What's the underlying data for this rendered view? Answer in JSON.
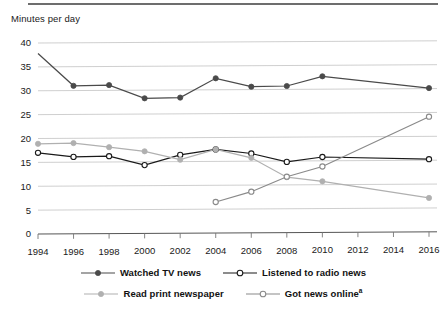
{
  "axis_title": "Minutes per day",
  "chart_data": {
    "type": "line",
    "title": "",
    "subtitle": "",
    "xlabel": "",
    "ylabel": "Minutes per day",
    "ylim": [
      0,
      40
    ],
    "ytick_step": 5,
    "yticks": [
      "0",
      "5",
      "10",
      "15",
      "20",
      "25",
      "30",
      "35",
      "40"
    ],
    "xlim": [
      1994,
      2016
    ],
    "xtick_step": 2,
    "categories": [
      1994,
      1996,
      1998,
      2000,
      2002,
      2004,
      2006,
      2008,
      2010,
      2012,
      2014,
      2016
    ],
    "xticks": [
      "1994",
      "1996",
      "1998",
      "2000",
      "2002",
      "2004",
      "2006",
      "2008",
      "2010",
      "2012",
      "2014",
      "2016"
    ],
    "grid": "horizontal",
    "legend_position": "bottom",
    "series": [
      {
        "name": "Watched TV news",
        "color": "#4a4a4a",
        "marker": "filled-circle",
        "x": [
          1994,
          1996,
          1998,
          2000,
          2002,
          2004,
          2006,
          2008,
          2010,
          2016
        ],
        "values": [
          37.8,
          31.0,
          31.1,
          28.3,
          28.4,
          32.4,
          30.6,
          30.7,
          32.7,
          30.1
        ]
      },
      {
        "name": "Listened to radio news",
        "color": "#1a1a1a",
        "marker": "open-circle",
        "x": [
          1994,
          1996,
          1998,
          2000,
          2002,
          2004,
          2006,
          2008,
          2010,
          2016
        ],
        "values": [
          17.0,
          16.1,
          16.2,
          14.3,
          16.4,
          17.5,
          16.6,
          14.8,
          15.8,
          15.2
        ]
      },
      {
        "name": "Read print newspaper",
        "color": "#b0b0b0",
        "marker": "filled-circle",
        "x": [
          1994,
          1996,
          1998,
          2000,
          2002,
          2004,
          2006,
          2008,
          2010,
          2016
        ],
        "values": [
          18.9,
          19.0,
          18.1,
          17.2,
          15.4,
          17.5,
          15.7,
          11.6,
          10.7,
          7.1
        ]
      },
      {
        "name": "Got news online",
        "name_footnote": "a",
        "color": "#8a8a8a",
        "marker": "open-circle",
        "x": [
          2004,
          2006,
          2008,
          2010,
          2016
        ],
        "values": [
          6.5,
          8.6,
          11.7,
          13.8,
          24.1
        ]
      }
    ]
  },
  "legend": {
    "rows": [
      [
        {
          "label": "Watched TV news",
          "color": "#4a4a4a",
          "marker": "filled-circle"
        },
        {
          "label": "Listened to radio news",
          "color": "#1a1a1a",
          "marker": "open-circle"
        }
      ],
      [
        {
          "label": "Read print newspaper",
          "color": "#b0b0b0",
          "marker": "filled-circle"
        },
        {
          "label": "Got news online",
          "footnote": "a",
          "color": "#8a8a8a",
          "marker": "open-circle"
        }
      ]
    ]
  }
}
